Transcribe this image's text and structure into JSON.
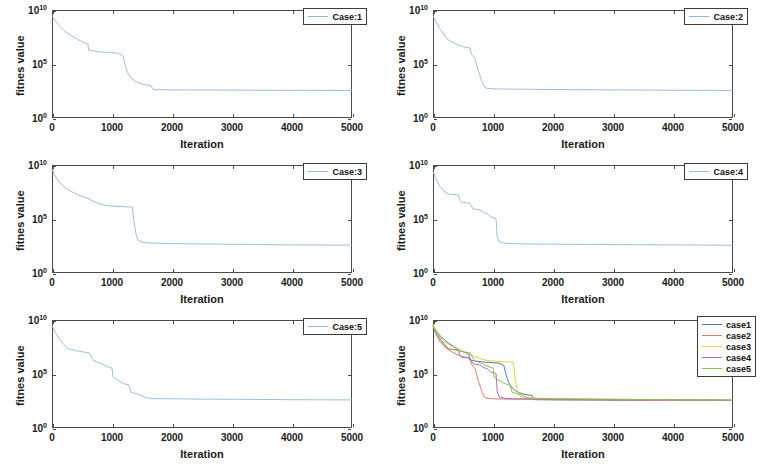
{
  "figure": {
    "kind": "multi-panel-convergence-figure",
    "panel_count": 6,
    "columns": 2,
    "rows": 3
  },
  "axes": {
    "xlabel": "Iteration",
    "ylabel": "fitnes value",
    "xticks": [
      "0",
      "1000",
      "2000",
      "3000",
      "4000",
      "5000"
    ],
    "xtick_values": [
      0,
      1000,
      2000,
      3000,
      4000,
      5000
    ],
    "yticks": [
      "10",
      "10",
      "10"
    ],
    "yexps": [
      "10",
      "5",
      "0"
    ],
    "ytick_values": [
      10,
      5,
      0
    ],
    "xlim": [
      0,
      5000
    ],
    "ylim_exp": [
      0,
      10
    ],
    "yscale": "log",
    "grid": false,
    "box": true
  },
  "colors": {
    "single_line": "#8fb8de",
    "case1": "#4a7ebb",
    "case2": "#e07b72",
    "case3": "#e8d24b",
    "case4": "#b06cc0",
    "case5": "#8fc04a",
    "axis": "#4a4a4a",
    "text": "#1a1a1a",
    "background": "#ffffff"
  },
  "chart_data": [
    {
      "type": "line",
      "title": "",
      "panel_index": 0,
      "xlabel": "Iteration",
      "ylabel": "fitnes value",
      "yscale": "log",
      "xlim": [
        0,
        5000
      ],
      "ylim": [
        1,
        10000000000
      ],
      "legend": [
        "Case:1"
      ],
      "legend_position": "top-right",
      "series": [
        {
          "name": "Case:1",
          "color": "#8fb8de",
          "x": [
            0,
            40,
            110,
            200,
            300,
            420,
            560,
            600,
            610,
            700,
            850,
            1000,
            1100,
            1180,
            1220,
            1260,
            1320,
            1400,
            1500,
            1600,
            1650,
            1680,
            1700,
            2000,
            3000,
            4000,
            5000
          ],
          "y_exp": [
            9.5,
            9.1,
            8.6,
            8.1,
            7.7,
            7.3,
            6.9,
            6.85,
            6.3,
            6.2,
            6.1,
            6.05,
            6.0,
            5.8,
            4.9,
            4.2,
            3.7,
            3.35,
            3.15,
            3.05,
            3.0,
            2.7,
            2.62,
            2.6,
            2.58,
            2.56,
            2.55
          ]
        }
      ]
    },
    {
      "type": "line",
      "title": "",
      "panel_index": 1,
      "xlabel": "Iteration",
      "ylabel": "fitnes value",
      "yscale": "log",
      "xlim": [
        0,
        5000
      ],
      "ylim": [
        1,
        10000000000
      ],
      "legend": [
        "Case:2"
      ],
      "legend_position": "top-right",
      "series": [
        {
          "name": "Case:2",
          "color": "#8fb8de",
          "x": [
            0,
            40,
            110,
            200,
            260,
            300,
            400,
            500,
            600,
            620,
            640,
            700,
            760,
            820,
            860,
            900,
            1000,
            1200,
            2000,
            3000,
            4000,
            5000
          ],
          "y_exp": [
            9.5,
            9.0,
            8.3,
            7.6,
            7.2,
            7.1,
            6.8,
            6.6,
            6.5,
            6.45,
            5.9,
            5.5,
            4.3,
            3.3,
            2.85,
            2.75,
            2.7,
            2.68,
            2.64,
            2.6,
            2.57,
            2.55
          ]
        }
      ]
    },
    {
      "type": "line",
      "title": "",
      "panel_index": 2,
      "xlabel": "Iteration",
      "ylabel": "fitnes value",
      "yscale": "log",
      "xlim": [
        0,
        5000
      ],
      "ylim": [
        1,
        10000000000
      ],
      "legend": [
        "Case:3"
      ],
      "legend_position": "top-right",
      "series": [
        {
          "name": "Case:3",
          "color": "#8fb8de",
          "x": [
            0,
            40,
            120,
            220,
            300,
            340,
            450,
            600,
            700,
            800,
            900,
            1000,
            1150,
            1280,
            1340,
            1360,
            1400,
            1430,
            1500,
            1600,
            2000,
            3000,
            4000,
            5000
          ],
          "y_exp": [
            9.6,
            9.1,
            8.4,
            7.9,
            7.6,
            7.5,
            7.2,
            6.9,
            6.6,
            6.4,
            6.25,
            6.2,
            6.15,
            6.12,
            6.1,
            5.0,
            3.6,
            3.05,
            2.85,
            2.78,
            2.72,
            2.66,
            2.6,
            2.58
          ]
        }
      ]
    },
    {
      "type": "line",
      "title": "",
      "panel_index": 3,
      "xlabel": "Iteration",
      "ylabel": "fitnes value",
      "yscale": "log",
      "xlim": [
        0,
        5000
      ],
      "ylim": [
        1,
        10000000000
      ],
      "legend": [
        "Case:4"
      ],
      "legend_position": "top-right",
      "series": [
        {
          "name": "Case:4",
          "color": "#8fb8de",
          "x": [
            0,
            40,
            120,
            200,
            270,
            300,
            420,
            450,
            480,
            560,
            620,
            660,
            700,
            780,
            840,
            900,
            960,
            1020,
            1050,
            1070,
            1100,
            1200,
            1400,
            1700,
            2000,
            3000,
            4000,
            5000
          ],
          "y_exp": [
            9.4,
            8.8,
            8.0,
            7.5,
            7.3,
            7.28,
            7.25,
            6.7,
            6.55,
            6.5,
            6.45,
            6.0,
            5.9,
            5.85,
            5.6,
            5.5,
            5.2,
            5.1,
            5.05,
            3.4,
            2.9,
            2.75,
            2.7,
            2.68,
            2.67,
            2.63,
            2.6,
            2.57
          ]
        }
      ]
    },
    {
      "type": "line",
      "title": "",
      "panel_index": 4,
      "xlabel": "Iteration",
      "ylabel": "fitnes value",
      "yscale": "log",
      "xlim": [
        0,
        5000
      ],
      "ylim": [
        1,
        10000000000
      ],
      "legend": [
        "Case:5"
      ],
      "legend_position": "top-right",
      "series": [
        {
          "name": "Case:5",
          "color": "#8fb8de",
          "x": [
            0,
            40,
            130,
            220,
            260,
            300,
            420,
            560,
            620,
            680,
            700,
            760,
            840,
            900,
            960,
            1000,
            1020,
            1100,
            1200,
            1280,
            1320,
            1420,
            1500,
            1560,
            1700,
            2000,
            3000,
            4000,
            5000
          ],
          "y_exp": [
            9.5,
            9.0,
            8.2,
            7.6,
            7.35,
            7.3,
            7.15,
            7.0,
            6.95,
            6.35,
            6.2,
            6.1,
            5.9,
            5.75,
            5.6,
            5.55,
            4.7,
            4.4,
            4.1,
            4.0,
            3.3,
            3.15,
            3.0,
            2.8,
            2.72,
            2.7,
            2.66,
            2.62,
            2.6
          ]
        }
      ]
    },
    {
      "type": "line",
      "title": "",
      "panel_index": 5,
      "xlabel": "Iteration",
      "ylabel": "fitnes value",
      "yscale": "log",
      "xlim": [
        0,
        5000
      ],
      "ylim": [
        1,
        10000000000
      ],
      "legend": [
        "case1",
        "case2",
        "case3",
        "case4",
        "case5"
      ],
      "legend_position": "top-right",
      "series": [
        {
          "name": "case1",
          "color": "#4a7ebb",
          "x": [
            0,
            40,
            110,
            200,
            300,
            420,
            560,
            600,
            610,
            700,
            850,
            1000,
            1100,
            1180,
            1220,
            1260,
            1320,
            1400,
            1500,
            1600,
            1650,
            1680,
            1700,
            2000,
            3000,
            4000,
            5000
          ],
          "y_exp": [
            9.5,
            9.1,
            8.6,
            8.1,
            7.7,
            7.3,
            6.9,
            6.85,
            6.3,
            6.2,
            6.1,
            6.05,
            6.0,
            5.8,
            4.9,
            4.2,
            3.7,
            3.35,
            3.15,
            3.05,
            3.0,
            2.7,
            2.62,
            2.6,
            2.58,
            2.56,
            2.55
          ]
        },
        {
          "name": "case2",
          "color": "#e07b72",
          "x": [
            0,
            40,
            110,
            200,
            260,
            300,
            400,
            500,
            600,
            620,
            640,
            700,
            760,
            820,
            860,
            900,
            1000,
            1200,
            2000,
            3000,
            4000,
            5000
          ],
          "y_exp": [
            9.5,
            9.0,
            8.3,
            7.6,
            7.2,
            7.1,
            6.8,
            6.6,
            6.5,
            6.45,
            5.9,
            5.5,
            4.3,
            3.3,
            2.85,
            2.75,
            2.7,
            2.68,
            2.64,
            2.6,
            2.57,
            2.55
          ]
        },
        {
          "name": "case3",
          "color": "#e8d24b",
          "x": [
            0,
            40,
            120,
            220,
            300,
            340,
            450,
            600,
            700,
            800,
            900,
            1000,
            1150,
            1280,
            1340,
            1360,
            1400,
            1430,
            1500,
            1600,
            2000,
            3000,
            4000,
            5000
          ],
          "y_exp": [
            9.6,
            9.1,
            8.4,
            7.9,
            7.6,
            7.5,
            7.2,
            6.9,
            6.6,
            6.4,
            6.25,
            6.2,
            6.15,
            6.12,
            6.1,
            5.0,
            3.6,
            3.05,
            2.85,
            2.78,
            2.72,
            2.66,
            2.6,
            2.58
          ]
        },
        {
          "name": "case4",
          "color": "#b06cc0",
          "x": [
            0,
            40,
            120,
            200,
            270,
            300,
            420,
            450,
            480,
            560,
            620,
            660,
            700,
            780,
            840,
            900,
            960,
            1020,
            1050,
            1070,
            1100,
            1200,
            1400,
            1700,
            2000,
            3000,
            4000,
            5000
          ],
          "y_exp": [
            9.4,
            8.8,
            8.0,
            7.5,
            7.3,
            7.28,
            7.25,
            6.7,
            6.55,
            6.5,
            6.45,
            6.0,
            5.9,
            5.85,
            5.6,
            5.5,
            5.2,
            5.1,
            5.05,
            3.4,
            2.9,
            2.75,
            2.7,
            2.68,
            2.67,
            2.63,
            2.6,
            2.57
          ]
        },
        {
          "name": "case5",
          "color": "#8fc04a",
          "x": [
            0,
            40,
            130,
            220,
            260,
            300,
            420,
            560,
            620,
            680,
            700,
            760,
            840,
            900,
            960,
            1000,
            1020,
            1100,
            1200,
            1280,
            1320,
            1420,
            1500,
            1560,
            1700,
            2000,
            3000,
            4000,
            5000
          ],
          "y_exp": [
            9.5,
            9.0,
            8.2,
            7.6,
            7.35,
            7.3,
            7.15,
            7.0,
            6.95,
            6.35,
            6.2,
            6.1,
            5.9,
            5.75,
            5.6,
            5.55,
            4.7,
            4.4,
            4.1,
            4.0,
            3.3,
            3.15,
            3.0,
            2.8,
            2.72,
            2.7,
            2.66,
            2.62,
            2.6
          ]
        }
      ]
    }
  ]
}
